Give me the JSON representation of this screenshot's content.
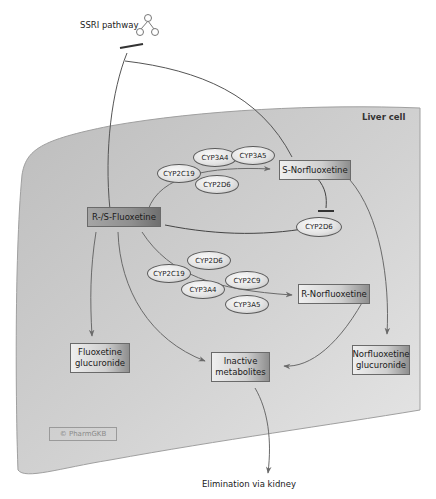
{
  "diagram": {
    "title_region": "Liver cell",
    "pathway_link": {
      "label": "SSRI pathway",
      "icon": "pathway-tree-icon"
    },
    "nodes": {
      "parent": "R-/S-Fluoxetine",
      "s_metabolite": "S-Norfluoxetine",
      "r_metabolite": "R-Norfluoxetine",
      "fluoxetine_glucuronide": "Fluoxetine glucuronide",
      "inactive": "Inactive metabolites",
      "norfluoxetine_glucuronide": "Norfluoxetine glucuronide",
      "inhibited_enzyme": "CYP2D6"
    },
    "s_pathway_enzymes": [
      "CYP2C19",
      "CYP3A4",
      "CYP3A5",
      "CYP2D6"
    ],
    "r_pathway_enzymes": [
      "CYP2C19",
      "CYP2D6",
      "CYP3A4",
      "CYP2C9",
      "CYP3A5"
    ],
    "elimination": "Elimination via kidney",
    "watermark": "© PharmGKB",
    "colors": {
      "cell_fill": "#c4c4c4",
      "cell_edge": "#9a9a9a",
      "line": "#555555"
    }
  }
}
